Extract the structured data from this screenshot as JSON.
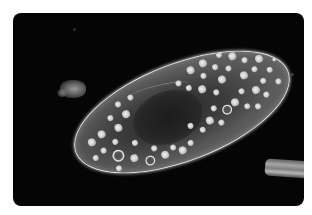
{
  "image": {
    "description": "Darkfield micrograph of a paramecium (ciliate protozoan) on black background with rounded corners",
    "subject": "paramecium cell",
    "background_color": "#050505",
    "page_color": "#ffffff",
    "outline_color": "#e6e6e6"
  },
  "scene": {
    "frame": {
      "x": 13,
      "y": 13,
      "width": 291,
      "height": 193,
      "corner_radius": 8
    },
    "cell": {
      "center": [
        168,
        110
      ],
      "length": 226,
      "width": 96,
      "rotation_deg": -21
    },
    "nucleus": {
      "description": "dark granular central region"
    },
    "debris": [
      {
        "name": "left-debris",
        "x": 60,
        "y": 80
      },
      {
        "name": "rod-fragment",
        "x": 265,
        "y": 160
      }
    ],
    "vacuoles": [
      {
        "x": 18,
        "y": 44,
        "r": 4
      },
      {
        "x": 26,
        "y": 56,
        "r": 3
      },
      {
        "x": 16,
        "y": 60,
        "r": 3
      },
      {
        "x": 30,
        "y": 40,
        "r": 4
      },
      {
        "x": 38,
        "y": 66,
        "r": 6,
        "ring": true
      },
      {
        "x": 40,
        "y": 52,
        "r": 3
      },
      {
        "x": 48,
        "y": 40,
        "r": 4
      },
      {
        "x": 52,
        "y": 74,
        "r": 4
      },
      {
        "x": 58,
        "y": 60,
        "r": 3
      },
      {
        "x": 44,
        "y": 28,
        "r": 3
      },
      {
        "x": 60,
        "y": 30,
        "r": 4
      },
      {
        "x": 34,
        "y": 78,
        "r": 3
      },
      {
        "x": 66,
        "y": 82,
        "r": 5,
        "ring": true
      },
      {
        "x": 74,
        "y": 72,
        "r": 3
      },
      {
        "x": 82,
        "y": 82,
        "r": 4
      },
      {
        "x": 92,
        "y": 78,
        "r": 3
      },
      {
        "x": 100,
        "y": 84,
        "r": 4
      },
      {
        "x": 110,
        "y": 80,
        "r": 3
      },
      {
        "x": 56,
        "y": 18,
        "r": 3
      },
      {
        "x": 70,
        "y": 16,
        "r": 3
      },
      {
        "x": 136,
        "y": 12,
        "r": 4
      },
      {
        "x": 146,
        "y": 22,
        "r": 3
      },
      {
        "x": 150,
        "y": 10,
        "r": 4
      },
      {
        "x": 160,
        "y": 18,
        "r": 3
      },
      {
        "x": 168,
        "y": 8,
        "r": 3
      },
      {
        "x": 140,
        "y": 34,
        "r": 4
      },
      {
        "x": 152,
        "y": 42,
        "r": 3
      },
      {
        "x": 162,
        "y": 32,
        "r": 4
      },
      {
        "x": 172,
        "y": 24,
        "r": 3
      },
      {
        "x": 180,
        "y": 14,
        "r": 4
      },
      {
        "x": 190,
        "y": 22,
        "r": 3
      },
      {
        "x": 184,
        "y": 36,
        "r": 4
      },
      {
        "x": 196,
        "y": 34,
        "r": 3
      },
      {
        "x": 204,
        "y": 26,
        "r": 4
      },
      {
        "x": 210,
        "y": 40,
        "r": 3
      },
      {
        "x": 200,
        "y": 48,
        "r": 3
      },
      {
        "x": 190,
        "y": 54,
        "r": 4
      },
      {
        "x": 176,
        "y": 50,
        "r": 3
      },
      {
        "x": 166,
        "y": 58,
        "r": 4
      },
      {
        "x": 156,
        "y": 62,
        "r": 5,
        "ring": true
      },
      {
        "x": 144,
        "y": 56,
        "r": 3
      },
      {
        "x": 136,
        "y": 66,
        "r": 4
      },
      {
        "x": 126,
        "y": 72,
        "r": 3
      },
      {
        "x": 146,
        "y": 72,
        "r": 3
      },
      {
        "x": 176,
        "y": 66,
        "r": 3
      },
      {
        "x": 186,
        "y": 70,
        "r": 3
      },
      {
        "x": 214,
        "y": 54,
        "r": 3
      },
      {
        "x": 120,
        "y": 20,
        "r": 3
      },
      {
        "x": 128,
        "y": 28,
        "r": 3
      },
      {
        "x": 116,
        "y": 64,
        "r": 3
      },
      {
        "x": 198,
        "y": 62,
        "r": 3
      },
      {
        "x": 218,
        "y": 32,
        "r": 2
      }
    ]
  }
}
